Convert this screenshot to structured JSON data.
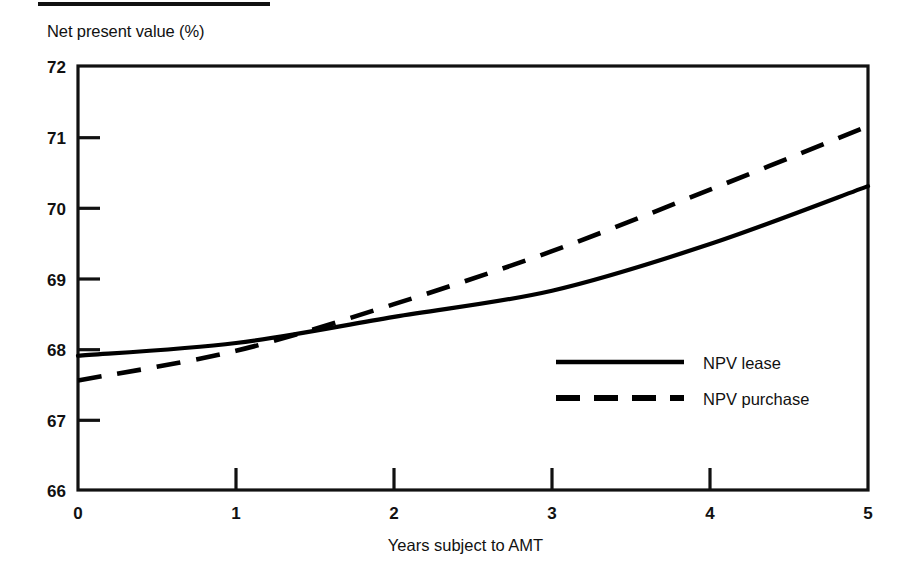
{
  "figure": {
    "y_axis_title": "Net present value (%)",
    "x_axis_title": "Years subject to AMT",
    "top_rule": "top-rule"
  },
  "axes": {
    "y_ticks": [
      "72",
      "71",
      "70",
      "69",
      "68",
      "67",
      "66"
    ],
    "x_ticks": [
      "0",
      "1",
      "2",
      "3",
      "4",
      "5"
    ]
  },
  "legend": {
    "entries": [
      {
        "label": "NPV lease",
        "style": "solid"
      },
      {
        "label": "NPV purchase",
        "style": "dashed"
      }
    ]
  },
  "chart_data": {
    "type": "line",
    "title": "",
    "subtitle": "",
    "xlabel": "Years subject to AMT",
    "ylabel": "Net present value (%)",
    "xlim": [
      0,
      5
    ],
    "ylim": [
      66,
      72
    ],
    "xticks": [
      0,
      1,
      2,
      3,
      4,
      5
    ],
    "yticks": [
      66,
      67,
      68,
      69,
      70,
      71,
      72
    ],
    "grid": false,
    "legend_position": "inside-right-lower",
    "x": [
      0,
      1,
      2,
      3,
      4,
      5
    ],
    "series": [
      {
        "name": "NPV lease",
        "style": "solid",
        "color": "#000000",
        "values": [
          67.9,
          68.08,
          68.45,
          68.82,
          69.48,
          70.3
        ]
      },
      {
        "name": "NPV purchase",
        "style": "dashed",
        "color": "#000000",
        "values": [
          67.55,
          67.97,
          68.63,
          69.38,
          70.25,
          71.15
        ]
      }
    ],
    "annotations": [
      "The two curves intersect at approximately x = 1.6 years, NPV = 68.25%"
    ]
  }
}
